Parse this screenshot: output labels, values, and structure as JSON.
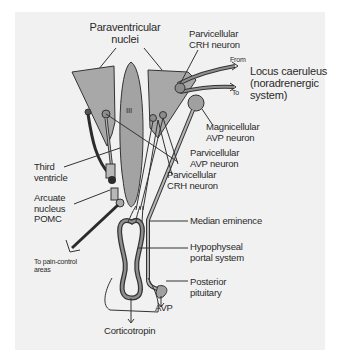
{
  "diagram": {
    "title": "",
    "colors": {
      "background": "#f1f1f1",
      "nucleus_fill": "#a8a8a8",
      "ventricle_fill": "#a3a3a3",
      "neuron_fill": "#9a9a9a",
      "line": "#333333",
      "dark_fiber": "#2b2b2b"
    },
    "labels": {
      "paraventricular_nuclei": [
        "Paraventricular",
        "nuclei"
      ],
      "third_ventricle_marker": "III",
      "parvicellular_crh_top": [
        "Parvicellular",
        "CRH neuron"
      ],
      "from": "From",
      "to": "To",
      "locus_caeruleus": [
        "Locus caeruleus",
        "(noradrenergic",
        "system)"
      ],
      "magnicellular_avp": [
        "Magnicellular",
        "AVP neuron"
      ],
      "parvicellular_avp": [
        "Parvicellular",
        "AVP neuron"
      ],
      "parvicellular_crh_mid": [
        "Parvicellular",
        "CRH neuron"
      ],
      "third_ventricle": [
        "Third",
        "ventricle"
      ],
      "arcuate_nucleus": [
        "Arcuate",
        "nucleus",
        "POMC"
      ],
      "median_eminence": "Median eminence",
      "hypophyseal_portal": [
        "Hypophyseal",
        "portal system"
      ],
      "to_pain_control": [
        "To pain-control",
        "areas"
      ],
      "posterior_pituitary": [
        "Posterior",
        "pituitary"
      ],
      "avp": "AVP",
      "corticotropin": "Corticotropin"
    }
  }
}
